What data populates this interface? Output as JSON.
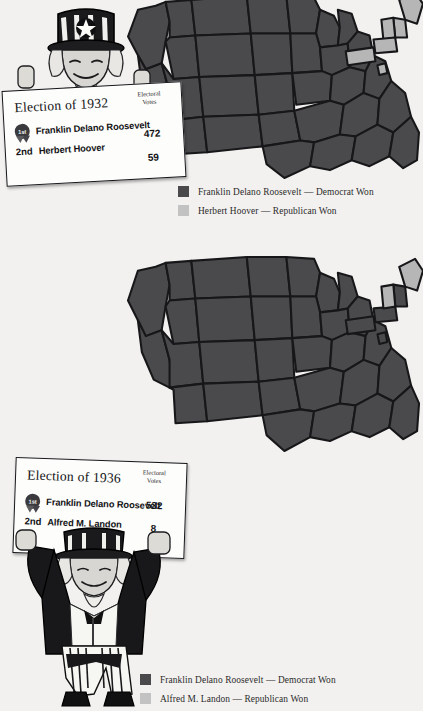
{
  "page": {
    "background_color": "#f2f1ef",
    "democrat_color": "#4a4a4c",
    "republican_color": "#b6b6b6"
  },
  "panels": [
    {
      "id": "1932",
      "card": {
        "title": "Election of 1932",
        "electoral_votes_header_line1": "Electoral",
        "electoral_votes_header_line2": "Votes",
        "rows": [
          {
            "rank": "1st",
            "candidate": "Franklin Delano Roosevelt",
            "electoral_votes": "472"
          },
          {
            "rank": "2nd",
            "candidate": "Herbert Hoover",
            "electoral_votes": "59"
          }
        ]
      },
      "legend": [
        {
          "swatch": "dem",
          "label": "Franklin Delano Roosevelt — Democrat Won"
        },
        {
          "swatch": "rep",
          "label": "Herbert Hoover — Republican Won"
        }
      ],
      "map": {
        "republican_states": [
          "Maine",
          "New Hampshire",
          "Vermont",
          "Connecticut",
          "Pennsylvania",
          "Delaware"
        ],
        "democrat_states_note": "all remaining states"
      }
    },
    {
      "id": "1936",
      "card": {
        "title": "Election of 1936",
        "electoral_votes_header_line1": "Electoral",
        "electoral_votes_header_line2": "Votes",
        "rows": [
          {
            "rank": "1st",
            "candidate": "Franklin Delano Roosevelt",
            "electoral_votes": "532"
          },
          {
            "rank": "2nd",
            "candidate": "Alfred M. Landon",
            "electoral_votes": "8"
          }
        ]
      },
      "legend": [
        {
          "swatch": "dem",
          "label": "Franklin Delano Roosevelt — Democrat Won"
        },
        {
          "swatch": "rep",
          "label": "Alfred M. Landon — Republican Won"
        }
      ],
      "map": {
        "republican_states": [
          "Maine",
          "Vermont"
        ],
        "democrat_states_note": "all remaining states"
      }
    }
  ]
}
